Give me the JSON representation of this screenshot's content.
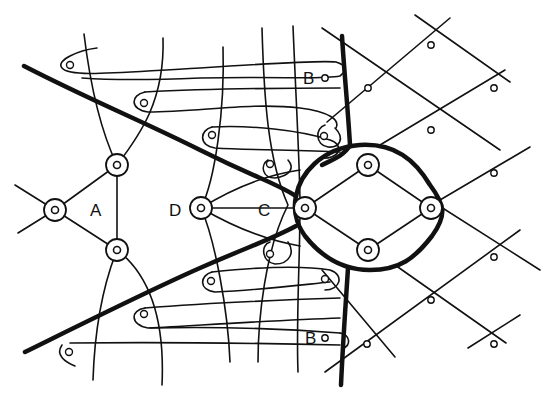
{
  "figure": {
    "type": "line-drawing-diagram",
    "background": "#ffffff",
    "stroke_color": "#111111"
  },
  "labels": {
    "A": "A",
    "B_top": "B",
    "B_bottom": "B",
    "C": "C",
    "D": "D"
  },
  "nodes": {
    "ring_left": {
      "x": 55,
      "y": 210
    },
    "ring_A_top": {
      "x": 117,
      "y": 165
    },
    "ring_A_bottom": {
      "x": 117,
      "y": 250
    },
    "ring_D": {
      "x": 201,
      "y": 208
    },
    "ring_center_left": {
      "x": 305,
      "y": 208
    },
    "ring_center_top": {
      "x": 368,
      "y": 165
    },
    "ring_center_right": {
      "x": 431,
      "y": 208
    },
    "ring_center_bottom": {
      "x": 368,
      "y": 250
    }
  }
}
